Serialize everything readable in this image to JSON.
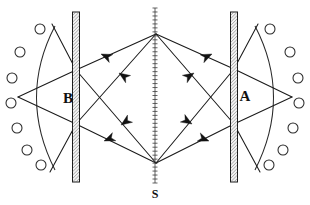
{
  "figure": {
    "width": 310,
    "height": 205,
    "background_color": "#ffffff",
    "line_color": "#1a1a1a"
  },
  "labels": {
    "left_plate_label": "B",
    "right_plate_label": "A",
    "source_label": "S"
  },
  "label_positions": {
    "left_plate_label": {
      "x": 68,
      "y": 100
    },
    "right_plate_label": {
      "x": 245,
      "y": 98
    },
    "source_label": {
      "x": 155,
      "y": 195
    }
  },
  "source": {
    "name": "S",
    "kind": "hatched-vertical-line",
    "x": 155,
    "y_top": 8,
    "y_bottom": 183,
    "width": 5,
    "hatch_count": 44,
    "color": "#3a3a3a"
  },
  "plates": [
    {
      "name": "B",
      "kind": "hatched-vertical-plate",
      "x": 76,
      "y_top": 12,
      "y_bottom": 182,
      "width": 7,
      "fill": "#f2f2f2",
      "stroke": "#1a1a1a"
    },
    {
      "name": "A",
      "kind": "hatched-vertical-plate",
      "x": 234,
      "y_top": 12,
      "y_bottom": 182,
      "width": 7,
      "fill": "#f2f2f2",
      "stroke": "#1a1a1a"
    }
  ],
  "arcs": [
    {
      "name": "left-arc",
      "side": "left",
      "center_x": 20,
      "center_y": 97,
      "radius": 78,
      "start": {
        "x": 55,
        "y": 26
      },
      "end": {
        "x": 55,
        "y": 170
      },
      "vertex": {
        "x": 18,
        "y": 97
      }
    },
    {
      "name": "right-arc",
      "side": "right",
      "center_x": 290,
      "center_y": 97,
      "radius": 78,
      "start": {
        "x": 255,
        "y": 26
      },
      "end": {
        "x": 255,
        "y": 170
      },
      "vertex": {
        "x": 292,
        "y": 97
      }
    }
  ],
  "detector_circles": {
    "radius": 5,
    "count_per_side": 7,
    "left": [
      {
        "x": 40,
        "y": 29
      },
      {
        "x": 20,
        "y": 52
      },
      {
        "x": 12,
        "y": 78
      },
      {
        "x": 11,
        "y": 103
      },
      {
        "x": 17,
        "y": 128
      },
      {
        "x": 27,
        "y": 150
      },
      {
        "x": 41,
        "y": 165
      }
    ],
    "right": [
      {
        "x": 270,
        "y": 29
      },
      {
        "x": 290,
        "y": 52
      },
      {
        "x": 298,
        "y": 78
      },
      {
        "x": 299,
        "y": 103
      },
      {
        "x": 293,
        "y": 128
      },
      {
        "x": 283,
        "y": 150
      },
      {
        "x": 269,
        "y": 165
      }
    ]
  },
  "nodes": {
    "source_top": {
      "x": 156,
      "y": 34
    },
    "source_bottom": {
      "x": 156,
      "y": 163
    },
    "plate_b_upper": {
      "x": 76,
      "y": 70
    },
    "plate_b_lower": {
      "x": 76,
      "y": 124
    },
    "plate_a_upper": {
      "x": 234,
      "y": 69
    },
    "plate_a_lower": {
      "x": 234,
      "y": 124
    },
    "left_focus": {
      "x": 18,
      "y": 97
    },
    "right_focus": {
      "x": 292,
      "y": 97
    },
    "left_arc_top": {
      "x": 55,
      "y": 26
    },
    "left_arc_bottom": {
      "x": 55,
      "y": 170
    },
    "right_arc_top": {
      "x": 255,
      "y": 26
    },
    "right_arc_bottom": {
      "x": 255,
      "y": 170
    }
  },
  "rays": [
    {
      "name": "ray-top-to-b-upper",
      "x1": 156,
      "y1": 34,
      "x2": 76,
      "y2": 70
    },
    {
      "name": "ray-top-to-b-lower",
      "x1": 156,
      "y1": 34,
      "x2": 76,
      "y2": 124
    },
    {
      "name": "ray-top-to-a-upper",
      "x1": 156,
      "y1": 34,
      "x2": 234,
      "y2": 69
    },
    {
      "name": "ray-top-to-a-lower",
      "x1": 156,
      "y1": 34,
      "x2": 234,
      "y2": 124
    },
    {
      "name": "ray-bottom-to-b-upper",
      "x1": 156,
      "y1": 163,
      "x2": 76,
      "y2": 70
    },
    {
      "name": "ray-bottom-to-b-lower",
      "x1": 156,
      "y1": 163,
      "x2": 76,
      "y2": 124
    },
    {
      "name": "ray-bottom-to-a-upper",
      "x1": 156,
      "y1": 163,
      "x2": 234,
      "y2": 69
    },
    {
      "name": "ray-bottom-to-a-lower",
      "x1": 156,
      "y1": 163,
      "x2": 234,
      "y2": 124
    },
    {
      "name": "ray-b-upper-to-focus",
      "x1": 76,
      "y1": 70,
      "x2": 18,
      "y2": 97
    },
    {
      "name": "ray-b-lower-to-focus",
      "x1": 76,
      "y1": 124,
      "x2": 18,
      "y2": 97
    },
    {
      "name": "ray-a-upper-to-focus",
      "x1": 234,
      "y1": 69,
      "x2": 292,
      "y2": 97
    },
    {
      "name": "ray-a-lower-to-focus",
      "x1": 234,
      "y1": 124,
      "x2": 292,
      "y2": 97
    },
    {
      "name": "ray-b-upper-to-arc-top",
      "x1": 76,
      "y1": 70,
      "x2": 52,
      "y2": 24
    },
    {
      "name": "ray-b-lower-to-arc-bottom",
      "x1": 76,
      "y1": 124,
      "x2": 50,
      "y2": 172
    },
    {
      "name": "ray-a-upper-to-arc-top",
      "x1": 234,
      "y1": 69,
      "x2": 258,
      "y2": 24
    },
    {
      "name": "ray-a-lower-to-arc-bottom",
      "x1": 234,
      "y1": 124,
      "x2": 260,
      "y2": 172
    }
  ],
  "arrows": [
    {
      "name": "arrow-upper-left-outer",
      "x": 101,
      "y": 54,
      "angle": 204,
      "direction": "left"
    },
    {
      "name": "arrow-upper-left-inner",
      "x": 119,
      "y": 73,
      "angle": 214,
      "direction": "left-down"
    },
    {
      "name": "arrow-upper-right-outer",
      "x": 212,
      "y": 54,
      "angle": 335,
      "direction": "right"
    },
    {
      "name": "arrow-upper-right-inner",
      "x": 194,
      "y": 73,
      "angle": 327,
      "direction": "right-down"
    },
    {
      "name": "arrow-lower-left-inner",
      "x": 121,
      "y": 125,
      "angle": 145,
      "direction": "left-up"
    },
    {
      "name": "arrow-lower-left-outer",
      "x": 104,
      "y": 141,
      "angle": 157,
      "direction": "left"
    },
    {
      "name": "arrow-lower-right-inner",
      "x": 192,
      "y": 124,
      "angle": 31,
      "direction": "right-up"
    },
    {
      "name": "arrow-lower-right-outer",
      "x": 209,
      "y": 141,
      "angle": 21,
      "direction": "right"
    }
  ]
}
